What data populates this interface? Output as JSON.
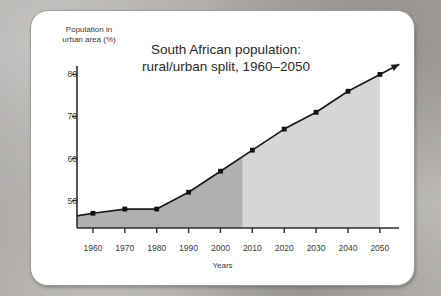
{
  "chart_data": {
    "type": "area",
    "title": "South African population:\nrural/urban split, 1960–2050",
    "title_line1": "South African population:",
    "title_line2": "rural/urban split, 1960–2050",
    "xlabel": "Years",
    "ylabel": "Population in urban area (%)",
    "ylabel_line1": "Population in",
    "ylabel_line2": "urban area (%)",
    "categories": [
      1960,
      1970,
      1980,
      1990,
      2000,
      2010,
      2020,
      2030,
      2040,
      2050
    ],
    "values": [
      47,
      48,
      48,
      52,
      57,
      62,
      67,
      71,
      76,
      80
    ],
    "series": [
      {
        "name": "Population in urban area (%)",
        "values": [
          47,
          48,
          48,
          52,
          57,
          62,
          67,
          71,
          76,
          80
        ]
      }
    ],
    "ytick_labels": [
      "80",
      "70",
      "60",
      "50"
    ],
    "ytick_values": [
      80,
      70,
      60,
      50
    ],
    "xtick_labels": [
      "1960",
      "1970",
      "1980",
      "1990",
      "2000",
      "2010",
      "2020",
      "2030",
      "2040",
      "2050"
    ],
    "ylim": [
      43.5,
      82
    ],
    "xlim": [
      1955,
      2056
    ],
    "grid": false,
    "legend_position": "none",
    "annotations": [
      {
        "text": "Projected",
        "x": 2025,
        "y": 58
      }
    ],
    "projection_start_year": 2007,
    "arrow_end": true,
    "colors": {
      "historical_fill": "#b0b0b0",
      "projected_fill": "#d6d6d6",
      "line": "#1a1a1a",
      "marker": "#111111",
      "axis": "#2e2e2e",
      "text": "#3a3a3a",
      "card_background": "#ffffff",
      "page_background": "#aaa7a4"
    }
  }
}
